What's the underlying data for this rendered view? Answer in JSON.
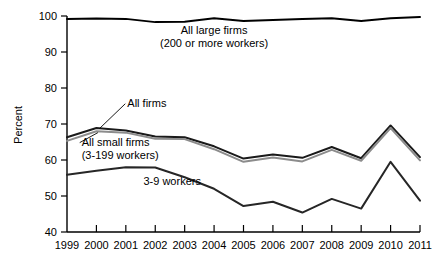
{
  "chart_data": {
    "type": "line",
    "title": "",
    "xlabel": "",
    "ylabel": "Percent",
    "categories": [
      1999,
      2000,
      2001,
      2002,
      2003,
      2004,
      2005,
      2006,
      2007,
      2008,
      2009,
      2010,
      2011
    ],
    "xlim": [
      1999,
      2011
    ],
    "ylim": [
      40,
      100
    ],
    "yticks": [
      40,
      50,
      60,
      70,
      80,
      90,
      100
    ],
    "xticks": [
      1999,
      2000,
      2001,
      2002,
      2003,
      2004,
      2005,
      2006,
      2007,
      2008,
      2009,
      2010,
      2011
    ],
    "grid": false,
    "legend_position": "inline-annotations",
    "series": [
      {
        "name": "All large firms (200 or more workers)",
        "color": "#000000",
        "values": [
          99.2,
          99.3,
          99.2,
          98.3,
          98.4,
          99.4,
          98.6,
          98.9,
          99.2,
          99.4,
          98.6,
          99.4,
          99.7
        ]
      },
      {
        "name": "All firms",
        "color": "#1a1a1a",
        "values": [
          66.3,
          68.9,
          68.2,
          66.5,
          66.3,
          63.8,
          60.4,
          61.5,
          60.6,
          63.6,
          60.5,
          69.6,
          60.8
        ]
      },
      {
        "name": "All small firms (3-199 workers)",
        "color": "#8c8c8c",
        "values": [
          65.3,
          68.0,
          67.6,
          65.9,
          65.8,
          63.0,
          59.5,
          60.7,
          59.6,
          62.8,
          59.8,
          68.9,
          59.9
        ]
      },
      {
        "name": "3-9 workers",
        "color": "#262626",
        "values": [
          55.9,
          57.0,
          58.0,
          57.9,
          55.2,
          52.0,
          47.2,
          48.4,
          45.4,
          49.2,
          46.5,
          59.5,
          48.7
        ]
      }
    ],
    "annotations": [
      {
        "id": "all-large-firms",
        "lines": [
          "All large firms",
          "(200 or more workers)"
        ],
        "x": 2004.0,
        "y": 95.0
      },
      {
        "id": "all-firms",
        "lines": [
          "All firms"
        ],
        "x": 2001.05,
        "y": 74.8,
        "leader_to": {
          "x": 2000.1,
          "y": 68.7
        }
      },
      {
        "id": "all-small-firms",
        "lines": [
          "All small firms",
          "(3-199 workers)"
        ],
        "x": 1999.5,
        "y": 64.0,
        "leader_to": {
          "x": 2000.05,
          "y": 67.6
        }
      },
      {
        "id": "three-to-nine-workers",
        "lines": [
          "3-9 workers"
        ],
        "x": 2001.6,
        "y": 53.0
      }
    ]
  }
}
